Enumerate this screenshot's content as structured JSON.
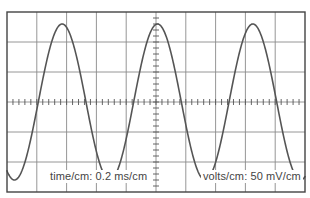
{
  "chart_data": {
    "type": "line",
    "title": "",
    "xlabel": "time/cm: 0.2 ms/cm",
    "ylabel": "volts/cm: 50 mV/cm",
    "grid": true,
    "grid_divisions": {
      "x": 10,
      "y": 6
    },
    "minor_ticks_per_division": 5,
    "xlim": [
      0,
      10
    ],
    "ylim": [
      -3,
      3
    ],
    "series": [
      {
        "name": "waveform",
        "shape": "sine",
        "amplitude_divisions": 2.6,
        "period_divisions": 3.2,
        "peak_x_divisions": [
          1.85,
          5.0,
          8.2
        ],
        "trough_x_divisions": [
          0.25,
          3.45,
          6.65,
          9.8
        ],
        "color": "#555555"
      }
    ],
    "derived": {
      "period_ms": 0.64,
      "frequency_hz": 1562,
      "amplitude_mV": 130,
      "peak_to_peak_mV": 260
    }
  },
  "labels": {
    "time": "time/cm: 0.2 ms/cm",
    "volts": "volts/cm: 50 mV/cm"
  },
  "colors": {
    "border": "#444444",
    "grid": "#8a8a8a",
    "axis": "#555555",
    "trace": "#555555",
    "text": "#444444",
    "background": "#ffffff"
  },
  "geometry": {
    "left": 7,
    "top": 12,
    "width": 298,
    "height": 180
  }
}
